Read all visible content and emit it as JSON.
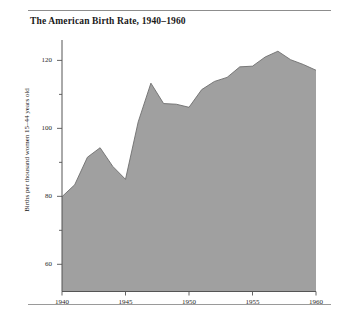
{
  "chart_data": {
    "type": "area",
    "title": "The American Birth Rate, 1940–1960",
    "xlabel": "",
    "ylabel": "Births per thousand women 15–44 years old",
    "xlim": [
      1940,
      1960
    ],
    "ylim": [
      52,
      126
    ],
    "grid": "vertical gridlines at 1945, 1950, 1955",
    "legend": "none",
    "fill_color": "#a0a0a0",
    "line_color": "#6e6e6e",
    "axis_color": "#555555",
    "x_ticks": [
      1940,
      1945,
      1950,
      1955,
      1960
    ],
    "x_tick_labels": [
      "1940",
      "1945",
      "1950",
      "1955",
      "1960"
    ],
    "y_ticks": [
      60,
      70,
      80,
      90,
      100,
      110,
      120
    ],
    "y_major_ticks": [
      60,
      80,
      100,
      120
    ],
    "y_tick_labels": [
      "60",
      "80",
      "100",
      "120"
    ],
    "x": [
      1940,
      1941,
      1942,
      1943,
      1944,
      1945,
      1946,
      1947,
      1948,
      1949,
      1950,
      1951,
      1952,
      1953,
      1954,
      1955,
      1956,
      1957,
      1958,
      1959,
      1960
    ],
    "values": [
      79.9,
      83.4,
      91.5,
      94.3,
      88.8,
      85.0,
      101.9,
      113.3,
      107.3,
      107.1,
      106.2,
      111.4,
      113.8,
      115.0,
      118.1,
      118.3,
      121.0,
      122.7,
      120.2,
      118.8,
      117.1
    ],
    "annotations": []
  },
  "figure": {
    "title": "The American Birth Rate, 1940–1960",
    "ylabel": "Births per thousand women 15–44 years old"
  }
}
